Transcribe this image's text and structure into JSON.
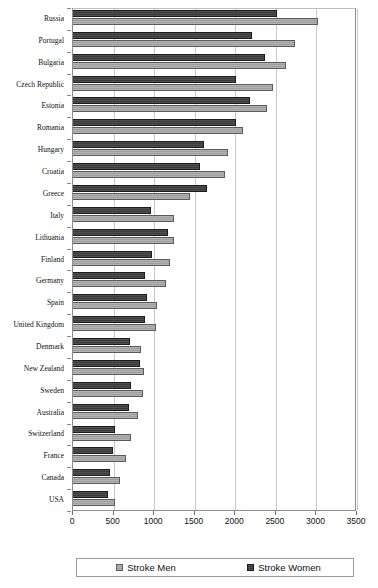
{
  "chart_data": {
    "type": "bar",
    "orientation": "horizontal",
    "title": "",
    "xlabel": "",
    "ylabel": "",
    "xlim": [
      0,
      3500
    ],
    "xticks": [
      0,
      500,
      1000,
      1500,
      2000,
      2500,
      3000,
      3500
    ],
    "xtick_labels": [
      "0",
      "500",
      "1000",
      "1500",
      "2000",
      "2500",
      "3000",
      "3500"
    ],
    "grid": true,
    "legend_position": "bottom",
    "categories": [
      "Russia",
      "Portugal",
      "Bulgaria",
      "Czech Republic",
      "Estonia",
      "Romania",
      "Hungary",
      "Croatia",
      "Greece",
      "Italy",
      "Lithuania",
      "Finland",
      "Germany",
      "Spain",
      "United Kingdom",
      "Denmark",
      "New Zealand",
      "Sweden",
      "Australia",
      "Switzerland",
      "France",
      "Canada",
      "USA"
    ],
    "series": [
      {
        "name": "Stroke Men",
        "color": "#9e9e9e",
        "values": [
          3020,
          2730,
          2620,
          2470,
          2390,
          2100,
          1910,
          1870,
          1440,
          1250,
          1240,
          1190,
          1150,
          1030,
          1020,
          840,
          880,
          860,
          800,
          710,
          650,
          580,
          520
        ]
      },
      {
        "name": "Stroke Women",
        "color": "#3b3b3b",
        "values": [
          2510,
          2200,
          2370,
          2010,
          2180,
          2010,
          1620,
          1570,
          1650,
          960,
          1170,
          970,
          890,
          910,
          890,
          700,
          820,
          720,
          690,
          520,
          490,
          460,
          430
        ]
      }
    ]
  },
  "legend": {
    "entries": [
      {
        "label": "Stroke Men",
        "swatch": "light-gray-swatch"
      },
      {
        "label": "Stroke Women",
        "swatch": "dark-gray-swatch"
      }
    ]
  }
}
